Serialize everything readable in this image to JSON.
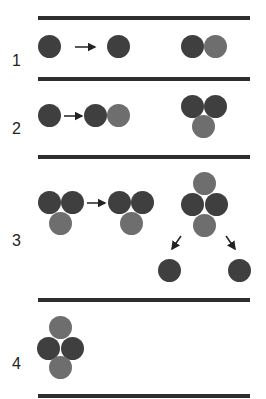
{
  "rows": [
    {
      "label": "1"
    },
    {
      "label": "2"
    },
    {
      "label": "3"
    },
    {
      "label": "4"
    }
  ],
  "colors": {
    "dark": "#3f3f3f",
    "gray": "#6e6e6e",
    "line": "#2e2e2e"
  }
}
